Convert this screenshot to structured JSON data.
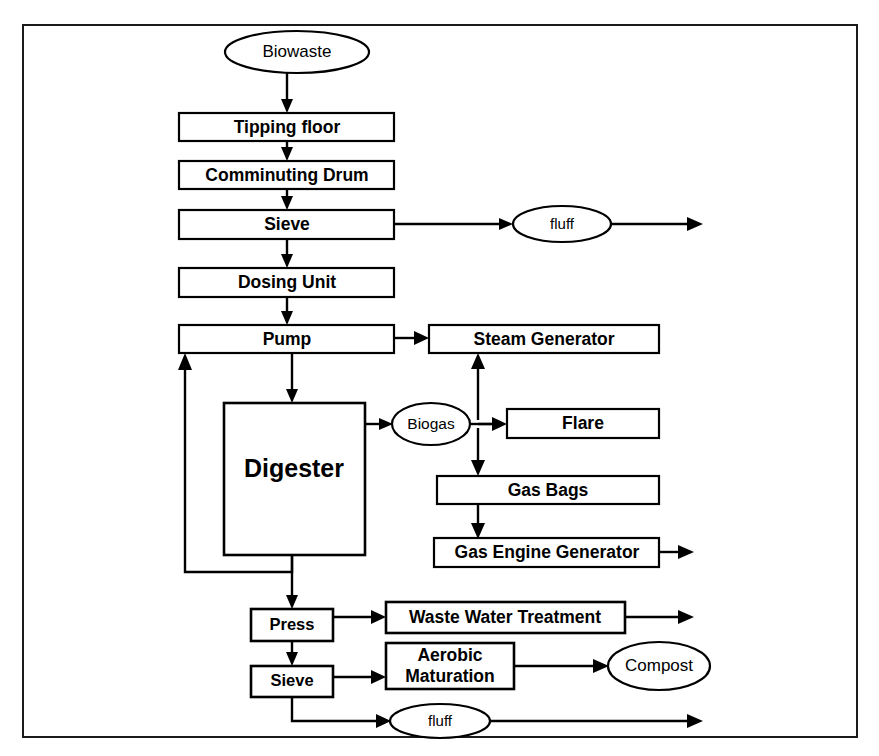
{
  "diagram": {
    "frame": {
      "stroke": "#1a1a1a"
    },
    "nodes": {
      "biowaste": {
        "label": "Biowaste",
        "shape": "ellipse"
      },
      "tipping_floor": {
        "label": "Tipping floor",
        "shape": "rect"
      },
      "comminuting_drum": {
        "label": "Comminuting Drum",
        "shape": "rect"
      },
      "sieve_top": {
        "label": "Sieve",
        "shape": "rect"
      },
      "fluff_top": {
        "label": "fluff",
        "shape": "ellipse"
      },
      "dosing_unit": {
        "label": "Dosing Unit",
        "shape": "rect"
      },
      "pump": {
        "label": "Pump",
        "shape": "rect"
      },
      "steam_generator": {
        "label": "Steam Generator",
        "shape": "rect"
      },
      "digester": {
        "label": "Digester",
        "shape": "rect"
      },
      "biogas": {
        "label": "Biogas",
        "shape": "ellipse"
      },
      "flare": {
        "label": "Flare",
        "shape": "rect"
      },
      "gas_bags": {
        "label": "Gas Bags",
        "shape": "rect"
      },
      "gas_engine_generator": {
        "label": "Gas Engine Generator",
        "shape": "rect"
      },
      "press": {
        "label": "Press",
        "shape": "rect"
      },
      "waste_water_treatment": {
        "label": "Waste Water Treatment",
        "shape": "rect"
      },
      "sieve_bottom": {
        "label": "Sieve",
        "shape": "rect"
      },
      "aerobic_maturation_line1": {
        "label": "Aerobic",
        "shape": "rect"
      },
      "aerobic_maturation_line2": {
        "label": "Maturation",
        "shape": "rect"
      },
      "compost": {
        "label": "Compost",
        "shape": "ellipse"
      },
      "fluff_bottom": {
        "label": "fluff",
        "shape": "ellipse"
      }
    },
    "edges": [
      {
        "from": "biowaste",
        "to": "tipping_floor"
      },
      {
        "from": "tipping_floor",
        "to": "comminuting_drum"
      },
      {
        "from": "comminuting_drum",
        "to": "sieve_top"
      },
      {
        "from": "sieve_top",
        "to": "fluff_top"
      },
      {
        "from": "fluff_top",
        "to": "out-right"
      },
      {
        "from": "sieve_top",
        "to": "dosing_unit"
      },
      {
        "from": "dosing_unit",
        "to": "pump"
      },
      {
        "from": "pump",
        "to": "steam_generator"
      },
      {
        "from": "pump",
        "to": "digester"
      },
      {
        "from": "digester",
        "to": "biogas"
      },
      {
        "from": "biogas",
        "to": "steam_generator"
      },
      {
        "from": "biogas",
        "to": "flare"
      },
      {
        "from": "biogas",
        "to": "gas_bags"
      },
      {
        "from": "gas_bags",
        "to": "gas_engine_generator"
      },
      {
        "from": "gas_engine_generator",
        "to": "out-right"
      },
      {
        "from": "digester",
        "to": "pump"
      },
      {
        "from": "digester",
        "to": "press"
      },
      {
        "from": "press",
        "to": "waste_water_treatment"
      },
      {
        "from": "waste_water_treatment",
        "to": "out-right"
      },
      {
        "from": "press",
        "to": "sieve_bottom"
      },
      {
        "from": "sieve_bottom",
        "to": "aerobic_maturation"
      },
      {
        "from": "aerobic_maturation",
        "to": "compost"
      },
      {
        "from": "sieve_bottom",
        "to": "fluff_bottom"
      },
      {
        "from": "fluff_bottom",
        "to": "out-right"
      }
    ]
  }
}
